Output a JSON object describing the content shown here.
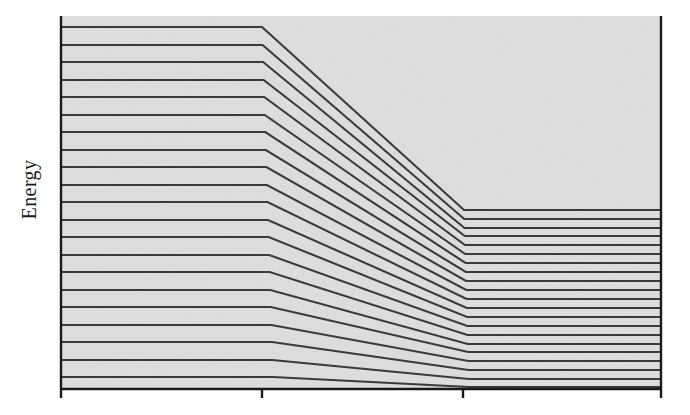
{
  "figure": {
    "kind": "energy-level-correlation-diagram",
    "background_color": "#ffffff",
    "plot_fill_color": "#dedede",
    "line_color": "#3a3a3a",
    "axis_color": "#1a1a1a"
  },
  "axes": {
    "y_axis_label": "Energy",
    "x_axis_label": "",
    "y_tick_labels": [],
    "x_tick_labels": [
      "",
      "",
      "",
      ""
    ],
    "x_tick_positions": [
      61,
      262,
      463,
      661
    ],
    "x_axis_y": 389,
    "y_axis_x": 61,
    "right_axis_x": 661,
    "plot_top": 16,
    "grid": false,
    "legend": null
  },
  "chart_data": {
    "type": "line",
    "title": "",
    "subtitle": "",
    "xlabel": "",
    "ylabel": "Energy",
    "xlim": [
      0,
      3
    ],
    "ylim": [
      0,
      1
    ],
    "grid": false,
    "legend_position": "none",
    "annotations": [],
    "x_breakpoints": [
      0,
      1,
      2,
      3
    ],
    "x_tick_labels": [
      "",
      "",
      "",
      ""
    ],
    "note": "Each series is one energy level. Values are normalized energy (0 = bottom axis, 1 = top of plot frame) at the four x breakpoints: left region is flat, the level descends between breakpoint 1 and 2, then is flat again to the right edge.",
    "series": [
      {
        "name": "level-1",
        "values": [
          0.971,
          0.971,
          0.48,
          0.48
        ]
      },
      {
        "name": "level-2",
        "values": [
          0.925,
          0.925,
          0.456,
          0.456
        ]
      },
      {
        "name": "level-3",
        "values": [
          0.88,
          0.88,
          0.434,
          0.434
        ]
      },
      {
        "name": "level-4",
        "values": [
          0.834,
          0.834,
          0.412,
          0.412
        ]
      },
      {
        "name": "level-5",
        "values": [
          0.789,
          0.789,
          0.39,
          0.39
        ]
      },
      {
        "name": "level-6",
        "values": [
          0.743,
          0.743,
          0.367,
          0.367
        ]
      },
      {
        "name": "level-7",
        "values": [
          0.698,
          0.698,
          0.345,
          0.345
        ]
      },
      {
        "name": "level-8",
        "values": [
          0.652,
          0.652,
          0.323,
          0.323
        ]
      },
      {
        "name": "level-9",
        "values": [
          0.607,
          0.607,
          0.301,
          0.301
        ]
      },
      {
        "name": "level-10",
        "values": [
          0.561,
          0.561,
          0.278,
          0.278
        ]
      },
      {
        "name": "level-11",
        "values": [
          0.516,
          0.516,
          0.256,
          0.256
        ]
      },
      {
        "name": "level-12",
        "values": [
          0.47,
          0.47,
          0.234,
          0.234
        ]
      },
      {
        "name": "level-13",
        "values": [
          0.425,
          0.425,
          0.212,
          0.212
        ]
      },
      {
        "name": "level-14",
        "values": [
          0.379,
          0.379,
          0.189,
          0.189
        ]
      },
      {
        "name": "level-15",
        "values": [
          0.334,
          0.334,
          0.167,
          0.167
        ]
      },
      {
        "name": "level-16",
        "values": [
          0.288,
          0.288,
          0.145,
          0.145
        ]
      },
      {
        "name": "level-17",
        "values": [
          0.243,
          0.243,
          0.123,
          0.123
        ]
      },
      {
        "name": "level-18",
        "values": [
          0.197,
          0.197,
          0.1,
          0.1
        ]
      },
      {
        "name": "level-19",
        "values": [
          0.152,
          0.152,
          0.078,
          0.078
        ]
      },
      {
        "name": "level-20",
        "values": [
          0.106,
          0.106,
          0.056,
          0.056
        ]
      },
      {
        "name": "level-21",
        "values": [
          0.061,
          0.061,
          0.034,
          0.034
        ]
      }
    ]
  },
  "geometry": {
    "left_x": 61,
    "kink1_x": 262,
    "kink2_x": 464,
    "right_x": 661,
    "axis_bottom_y": 389,
    "axis_top_y": 16,
    "left_level_y": [
      27,
      45,
      62,
      80,
      97,
      115,
      132,
      150,
      167,
      185,
      202,
      220,
      237,
      255,
      272,
      290,
      307,
      325,
      342,
      360,
      377
    ],
    "right_level_y": [
      210,
      219,
      228,
      236,
      245,
      254,
      263,
      272,
      281,
      290,
      299,
      308,
      317,
      326,
      335,
      344,
      352,
      361,
      370,
      379,
      387
    ],
    "line_width": 2.1,
    "axis_width": 2.4,
    "tick_length": 9
  }
}
